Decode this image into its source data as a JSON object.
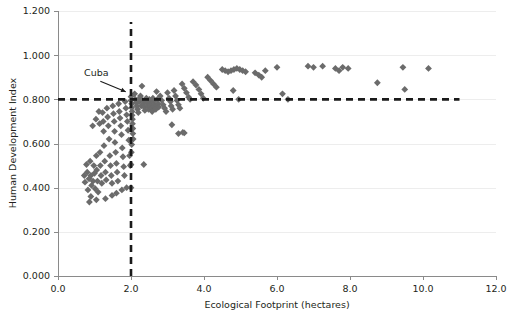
{
  "chart_data": {
    "type": "scatter",
    "title": "",
    "xlabel": "Ecological Footprint (hectares)",
    "ylabel": "Human Development Index",
    "xlim": [
      0.0,
      12.0
    ],
    "ylim": [
      0.0,
      1.2
    ],
    "xticks": [
      "0.0",
      "2.0",
      "4.0",
      "6.0",
      "8.0",
      "10.0",
      "12.0"
    ],
    "xtick_values": [
      0.0,
      2.0,
      4.0,
      6.0,
      8.0,
      10.0,
      12.0
    ],
    "yticks": [
      "0.000",
      "0.200",
      "0.400",
      "0.600",
      "0.800",
      "1.000",
      "1.200"
    ],
    "ytick_values": [
      0.0,
      0.2,
      0.4,
      0.6,
      0.8,
      1.0,
      1.2
    ],
    "grid": "horizontal",
    "legend": "none",
    "marker": "diamond",
    "marker_color": "#6b6b6b",
    "reference_lines": [
      {
        "name": "hdi-threshold",
        "orientation": "horizontal",
        "value": 0.8,
        "x_start": 0.0,
        "x_end": 11.0,
        "style": "dashed",
        "color": "#1a1a1a"
      },
      {
        "name": "footprint-threshold",
        "orientation": "vertical",
        "value": 2.0,
        "y_start": 0.0,
        "y_end": 1.15,
        "style": "dashed",
        "color": "#1a1a1a"
      }
    ],
    "annotations": [
      {
        "name": "cuba",
        "label": "Cuba",
        "label_x": 1.05,
        "label_y": 0.905,
        "point_x": 2.02,
        "point_y": 0.812
      }
    ],
    "points": [
      [
        0.72,
        0.455
      ],
      [
        0.74,
        0.425
      ],
      [
        0.78,
        0.505
      ],
      [
        0.8,
        0.47
      ],
      [
        0.82,
        0.39
      ],
      [
        0.85,
        0.44
      ],
      [
        0.86,
        0.335
      ],
      [
        0.88,
        0.52
      ],
      [
        0.9,
        0.455
      ],
      [
        0.92,
        0.41
      ],
      [
        0.95,
        0.68
      ],
      [
        0.96,
        0.43
      ],
      [
        0.98,
        0.5
      ],
      [
        1.0,
        0.465
      ],
      [
        1.02,
        0.395
      ],
      [
        1.04,
        0.71
      ],
      [
        1.05,
        0.545
      ],
      [
        1.06,
        0.48
      ],
      [
        1.08,
        0.43
      ],
      [
        1.1,
        0.38
      ],
      [
        1.12,
        0.745
      ],
      [
        1.14,
        0.69
      ],
      [
        1.15,
        0.56
      ],
      [
        1.16,
        0.5
      ],
      [
        1.18,
        0.455
      ],
      [
        1.2,
        0.42
      ],
      [
        1.22,
        0.74
      ],
      [
        1.24,
        0.7
      ],
      [
        1.25,
        0.655
      ],
      [
        1.26,
        0.59
      ],
      [
        1.28,
        0.52
      ],
      [
        1.3,
        0.47
      ],
      [
        1.32,
        0.435
      ],
      [
        1.34,
        0.76
      ],
      [
        1.36,
        0.72
      ],
      [
        1.38,
        0.68
      ],
      [
        1.4,
        0.62
      ],
      [
        1.42,
        0.545
      ],
      [
        1.44,
        0.5
      ],
      [
        1.46,
        0.455
      ],
      [
        1.48,
        0.42
      ],
      [
        1.5,
        0.77
      ],
      [
        1.52,
        0.735
      ],
      [
        1.54,
        0.7
      ],
      [
        1.55,
        0.655
      ],
      [
        1.56,
        0.605
      ],
      [
        1.58,
        0.56
      ],
      [
        1.6,
        0.51
      ],
      [
        1.62,
        0.47
      ],
      [
        1.64,
        0.43
      ],
      [
        1.66,
        0.78
      ],
      [
        1.68,
        0.745
      ],
      [
        1.7,
        0.715
      ],
      [
        1.72,
        0.68
      ],
      [
        1.74,
        0.64
      ],
      [
        1.76,
        0.58
      ],
      [
        1.78,
        0.54
      ],
      [
        1.8,
        0.495
      ],
      [
        1.82,
        0.455
      ],
      [
        1.84,
        0.79
      ],
      [
        1.86,
        0.76
      ],
      [
        1.88,
        0.73
      ],
      [
        1.9,
        0.7
      ],
      [
        1.92,
        0.66
      ],
      [
        1.94,
        0.615
      ],
      [
        1.96,
        0.545
      ],
      [
        1.98,
        0.5
      ],
      [
        1.6,
        0.375
      ],
      [
        1.75,
        0.39
      ],
      [
        1.88,
        0.4
      ],
      [
        0.9,
        0.36
      ],
      [
        1.05,
        0.345
      ],
      [
        1.3,
        0.35
      ],
      [
        1.48,
        0.365
      ],
      [
        2.0,
        0.812
      ],
      [
        2.0,
        0.795
      ],
      [
        2.02,
        0.78
      ],
      [
        2.02,
        0.762
      ],
      [
        2.03,
        0.745
      ],
      [
        2.03,
        0.728
      ],
      [
        2.04,
        0.71
      ],
      [
        2.04,
        0.69
      ],
      [
        2.05,
        0.668
      ],
      [
        2.05,
        0.645
      ],
      [
        2.06,
        0.62
      ],
      [
        2.02,
        0.595
      ],
      [
        2.01,
        0.56
      ],
      [
        2.0,
        0.505
      ],
      [
        2.0,
        0.4
      ],
      [
        2.1,
        0.825
      ],
      [
        2.12,
        0.8
      ],
      [
        2.14,
        0.785
      ],
      [
        2.16,
        0.77
      ],
      [
        2.18,
        0.755
      ],
      [
        2.2,
        0.74
      ],
      [
        2.22,
        0.79
      ],
      [
        2.24,
        0.805
      ],
      [
        2.26,
        0.815
      ],
      [
        2.28,
        0.77
      ],
      [
        2.3,
        0.86
      ],
      [
        2.32,
        0.795
      ],
      [
        2.34,
        0.78
      ],
      [
        2.36,
        0.765
      ],
      [
        2.38,
        0.75
      ],
      [
        2.4,
        0.795
      ],
      [
        2.42,
        0.805
      ],
      [
        2.44,
        0.785
      ],
      [
        2.46,
        0.77
      ],
      [
        2.48,
        0.755
      ],
      [
        2.5,
        0.8
      ],
      [
        2.52,
        0.79
      ],
      [
        2.54,
        0.775
      ],
      [
        2.56,
        0.76
      ],
      [
        2.58,
        0.745
      ],
      [
        2.6,
        0.805
      ],
      [
        2.62,
        0.79
      ],
      [
        2.64,
        0.775
      ],
      [
        2.66,
        0.765
      ],
      [
        2.68,
        0.755
      ],
      [
        2.35,
        0.505
      ],
      [
        2.7,
        0.835
      ],
      [
        2.72,
        0.8
      ],
      [
        2.74,
        0.78
      ],
      [
        2.76,
        0.765
      ],
      [
        2.8,
        0.815
      ],
      [
        2.84,
        0.795
      ],
      [
        2.88,
        0.775
      ],
      [
        2.92,
        0.76
      ],
      [
        2.96,
        0.745
      ],
      [
        3.0,
        0.83
      ],
      [
        3.04,
        0.805
      ],
      [
        3.08,
        0.79
      ],
      [
        3.1,
        0.77
      ],
      [
        3.14,
        0.755
      ],
      [
        3.18,
        0.84
      ],
      [
        3.22,
        0.815
      ],
      [
        3.26,
        0.795
      ],
      [
        3.3,
        0.775
      ],
      [
        3.34,
        0.76
      ],
      [
        3.12,
        0.685
      ],
      [
        3.3,
        0.645
      ],
      [
        3.42,
        0.65
      ],
      [
        3.46,
        0.648
      ],
      [
        3.4,
        0.87
      ],
      [
        3.46,
        0.85
      ],
      [
        3.52,
        0.83
      ],
      [
        3.58,
        0.81
      ],
      [
        3.62,
        0.8
      ],
      [
        3.7,
        0.88
      ],
      [
        3.78,
        0.865
      ],
      [
        3.86,
        0.845
      ],
      [
        3.92,
        0.825
      ],
      [
        3.98,
        0.805
      ],
      [
        4.1,
        0.9
      ],
      [
        4.18,
        0.885
      ],
      [
        4.26,
        0.87
      ],
      [
        4.34,
        0.855
      ],
      [
        4.5,
        0.935
      ],
      [
        4.58,
        0.93
      ],
      [
        4.66,
        0.925
      ],
      [
        4.74,
        0.93
      ],
      [
        4.82,
        0.935
      ],
      [
        4.9,
        0.94
      ],
      [
        4.98,
        0.935
      ],
      [
        5.06,
        0.93
      ],
      [
        5.14,
        0.925
      ],
      [
        4.8,
        0.84
      ],
      [
        4.95,
        0.8
      ],
      [
        5.4,
        0.92
      ],
      [
        5.5,
        0.91
      ],
      [
        5.58,
        0.9
      ],
      [
        5.68,
        0.93
      ],
      [
        6.0,
        0.945
      ],
      [
        6.15,
        0.825
      ],
      [
        6.3,
        0.8
      ],
      [
        6.85,
        0.95
      ],
      [
        7.0,
        0.945
      ],
      [
        7.25,
        0.95
      ],
      [
        7.6,
        0.94
      ],
      [
        7.7,
        0.93
      ],
      [
        7.8,
        0.945
      ],
      [
        7.95,
        0.94
      ],
      [
        8.75,
        0.875
      ],
      [
        9.45,
        0.945
      ],
      [
        9.5,
        0.845
      ],
      [
        10.15,
        0.94
      ]
    ]
  },
  "plot": {
    "background": "#ffffff",
    "grid_color": "#ededed",
    "axis_color": "#8a8a8a"
  }
}
